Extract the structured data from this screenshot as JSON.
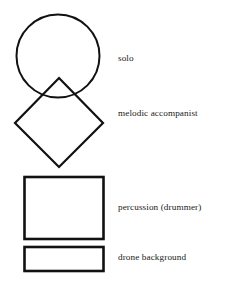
{
  "diagram": {
    "background_color": "#ffffff",
    "stroke_color": "#111111",
    "text_color": "#1a1a1a",
    "shapes": [
      {
        "id": "circle",
        "icon": "circle-shape",
        "label": "solo",
        "geometry": {
          "cx": 58,
          "cy": 56,
          "r": 41.5
        },
        "stroke_width": 2.0
      },
      {
        "id": "diamond",
        "icon": "diamond-shape",
        "label": "melodic accompanist",
        "geometry": {
          "points": "59,78 103,123 59,167 15,123"
        },
        "stroke_width": 2.2
      },
      {
        "id": "square",
        "icon": "square-shape",
        "label": "percussion (drummer)",
        "geometry": {
          "x": 24.5,
          "y": 177,
          "width": 79,
          "height": 62
        },
        "stroke_width": 2.6
      },
      {
        "id": "bar",
        "icon": "rectangle-shape",
        "label": "drone background",
        "geometry": {
          "x": 24.5,
          "y": 247,
          "width": 79,
          "height": 24
        },
        "stroke_width": 2.6
      }
    ]
  }
}
